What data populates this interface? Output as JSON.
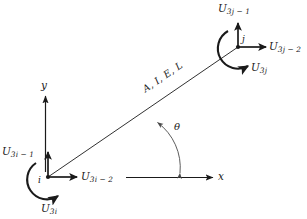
{
  "figure": {
    "type": "engineering-diagram",
    "stroke_color": "#1a1a1a",
    "background_color": "#ffffff"
  },
  "beam": {
    "property_label": "A, I, E, L",
    "angle_symbol": "θ"
  },
  "axes": {
    "x_label": "x",
    "y_label": "y"
  },
  "node_i": {
    "name": "i",
    "dof_axial": "U",
    "dof_axial_sub": "3i − 2",
    "dof_transverse": "U",
    "dof_transverse_sub": "3i − 1",
    "dof_rotation": "U",
    "dof_rotation_sub": "3i"
  },
  "node_j": {
    "name": "j",
    "dof_axial": "U",
    "dof_axial_sub": "3j − 2",
    "dof_transverse": "U",
    "dof_transverse_sub": "3j − 1",
    "dof_rotation": "U",
    "dof_rotation_sub": "3j"
  }
}
